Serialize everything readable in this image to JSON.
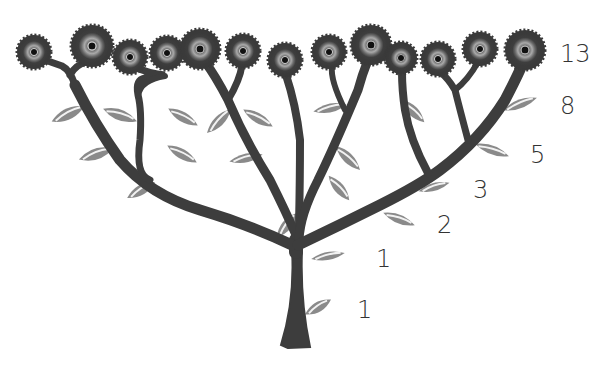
{
  "diagram": {
    "colors": {
      "trunk": "#3d3d3d",
      "leaf": "#8a8a8a",
      "leaf_vein": "#f2f2f2",
      "flower_petal": "#4a4a4a",
      "flower_ring": "#9a9a9a",
      "flower_center": "#111111",
      "label": "#333333",
      "background": "#ffffff"
    },
    "labels": [
      {
        "text": "13",
        "x": 560,
        "y": 42
      },
      {
        "text": "8",
        "x": 560,
        "y": 94
      },
      {
        "text": "5",
        "x": 530,
        "y": 143
      },
      {
        "text": "3",
        "x": 473,
        "y": 178
      },
      {
        "text": "2",
        "x": 437,
        "y": 213
      },
      {
        "text": "1",
        "x": 376,
        "y": 247
      },
      {
        "text": "1",
        "x": 357,
        "y": 298
      }
    ],
    "flowers": [
      {
        "x": 34,
        "y": 52,
        "r": 17
      },
      {
        "x": 92,
        "y": 46,
        "r": 21
      },
      {
        "x": 130,
        "y": 57,
        "r": 17
      },
      {
        "x": 167,
        "y": 53,
        "r": 17
      },
      {
        "x": 200,
        "y": 49,
        "r": 20
      },
      {
        "x": 243,
        "y": 51,
        "r": 17
      },
      {
        "x": 285,
        "y": 60,
        "r": 17
      },
      {
        "x": 329,
        "y": 52,
        "r": 17
      },
      {
        "x": 371,
        "y": 45,
        "r": 20
      },
      {
        "x": 401,
        "y": 58,
        "r": 16
      },
      {
        "x": 438,
        "y": 59,
        "r": 17
      },
      {
        "x": 480,
        "y": 49,
        "r": 17
      },
      {
        "x": 525,
        "y": 50,
        "r": 20
      }
    ]
  }
}
